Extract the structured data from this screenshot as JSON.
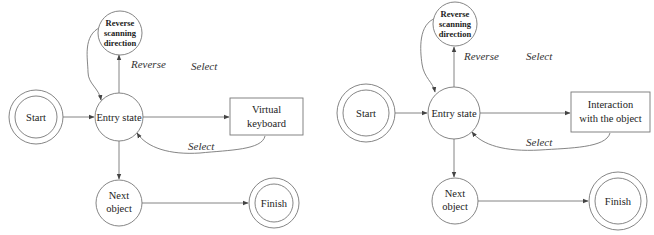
{
  "diagrams": [
    {
      "id": "left",
      "nodes": {
        "start": {
          "label": "Start"
        },
        "entry": {
          "label": "Entry state"
        },
        "reverse": {
          "line1": "Reverse",
          "line2": "scanning",
          "line3": "direction"
        },
        "action": {
          "line1": "Virtual",
          "line2": "keyboard"
        },
        "next": {
          "line1": "Next",
          "line2": "object"
        },
        "finish": {
          "label": "Finish"
        }
      },
      "edge_labels": {
        "reverse": "Reverse",
        "select_top": "Select",
        "select_return": "Select"
      }
    },
    {
      "id": "right",
      "nodes": {
        "start": {
          "label": "Start"
        },
        "entry": {
          "label": "Entry state"
        },
        "reverse": {
          "line1": "Reverse",
          "line2": "scanning",
          "line3": "direction"
        },
        "action": {
          "line1": "Interaction",
          "line2": "with the object"
        },
        "next": {
          "line1": "Next",
          "line2": "object"
        },
        "finish": {
          "label": "Finish"
        }
      },
      "edge_labels": {
        "reverse": "Reverse",
        "select_top": "Select",
        "select_return": "Select"
      }
    }
  ]
}
